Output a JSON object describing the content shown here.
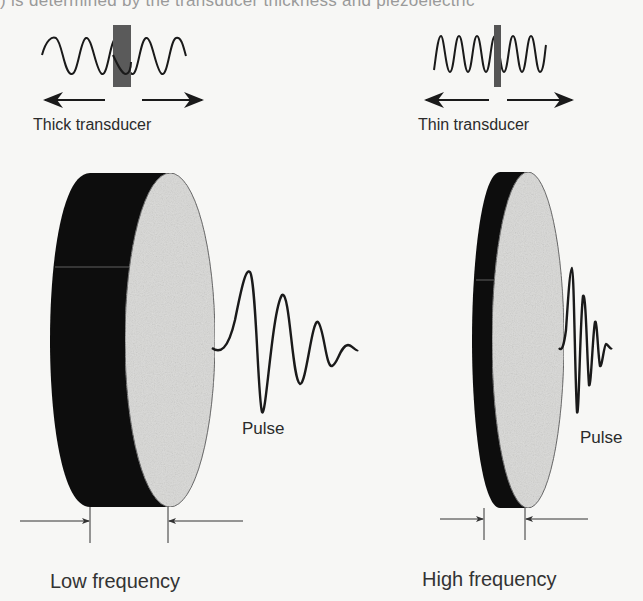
{
  "figure": {
    "top_caption": ") is determined by the transducer thickness and piezoelectric",
    "left_panel": {
      "transducer_label": "Thick transducer",
      "pulse_label": "Pulse",
      "frequency_label": "Low frequency"
    },
    "right_panel": {
      "transducer_label": "Thin transducer",
      "pulse_label": "Pulse",
      "frequency_label": "High frequency"
    },
    "colors": {
      "disk_back": "#0d0d0d",
      "disk_face": "#d9d9d7",
      "wave": "#1a1a1a",
      "marker": "#555555",
      "background": "#f7f7f5"
    }
  }
}
